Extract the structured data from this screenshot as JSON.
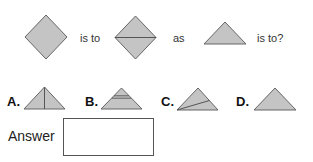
{
  "question": {
    "term1": "is to",
    "term2": "as",
    "term3": "is to?"
  },
  "figures": {
    "first": "diamond",
    "second": "diamond-with-horizontal-diagonal",
    "third": "triangle"
  },
  "options": [
    {
      "label": "A.",
      "figure": "triangle-with-vertical-line"
    },
    {
      "label": "B.",
      "figure": "triangle-with-horizontal-band"
    },
    {
      "label": "C.",
      "figure": "triangle-with-slanted-line"
    },
    {
      "label": "D.",
      "figure": "plain-triangle"
    }
  ],
  "answer": {
    "label": "Answer",
    "value": ""
  },
  "colors": {
    "shape_fill": "#c4c4c4",
    "shape_stroke": "#666666"
  }
}
